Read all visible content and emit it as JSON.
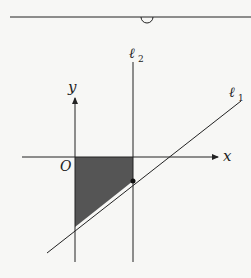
{
  "diagram": {
    "labels": {
      "y_axis": "y",
      "x_axis": "x",
      "origin": "O",
      "line1_base": "ℓ",
      "line1_sub": "1",
      "line2_base": "ℓ",
      "line2_sub": "2"
    },
    "colors": {
      "stroke": "#222222",
      "shade": "#555555",
      "background": "#f7f7f5"
    }
  }
}
